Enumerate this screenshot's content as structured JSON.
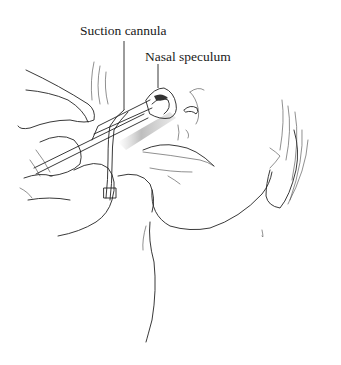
{
  "figure": {
    "labels": [
      {
        "id": "suction-cannula",
        "text": "Suction cannula",
        "x": 80,
        "y": 24,
        "leader": {
          "x": 124,
          "y1": 41,
          "y2": 110
        }
      },
      {
        "id": "nasal-speculum",
        "text": "Nasal speculum",
        "x": 145,
        "y": 50,
        "leader": {
          "x": 158,
          "y1": 64,
          "y2": 88
        }
      }
    ],
    "colors": {
      "line": "#222222",
      "shadow": "#9a9a9a",
      "background": "#ffffff"
    }
  }
}
